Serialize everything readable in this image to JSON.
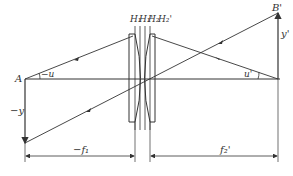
{
  "diagram": {
    "type": "thick-lens optical system ray diagram",
    "labels": {
      "object_point": "A",
      "image_point": "B'",
      "object_height": "−y",
      "image_height": "y'",
      "object_angle": "−u",
      "image_angle": "u'",
      "principal_planes": [
        "H₁",
        "H₁'",
        "H₂",
        "H₂'"
      ],
      "front_focal_length": "−f₁",
      "back_focal_length": "f₂'"
    },
    "colors": {
      "line": "#333333",
      "background": "#ffffff"
    }
  }
}
